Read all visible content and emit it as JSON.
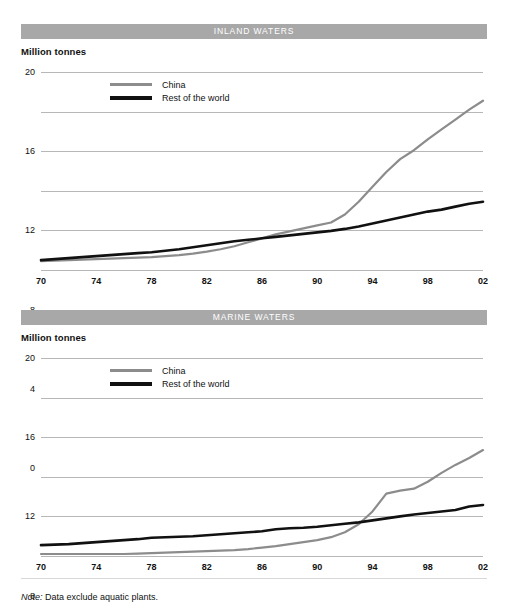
{
  "theme": {
    "bar_gray": "#a8a8a8",
    "china_color": "#8c8c8c",
    "row_color": "#111111",
    "grid_color": "#b7b7b7",
    "background": "#ffffff"
  },
  "charts": [
    {
      "title": "INLAND WATERS",
      "unit_label": "Million tonnes",
      "legend": [
        {
          "label": "China",
          "color": "#8c8c8c"
        },
        {
          "label": "Rest of the world",
          "color": "#111111"
        }
      ]
    },
    {
      "title": "MARINE WATERS",
      "unit_label": "Million tonnes",
      "legend": [
        {
          "label": "China",
          "color": "#8c8c8c"
        },
        {
          "label": "Rest of the world",
          "color": "#111111"
        }
      ]
    }
  ],
  "footnote": {
    "prefix": "Note:",
    "text": " Data exclude aquatic plants."
  },
  "chart_data": [
    {
      "type": "line",
      "title": "INLAND WATERS",
      "xlabel": "",
      "ylabel": "Million tonnes",
      "ylim": [
        0,
        20
      ],
      "yticks": [
        0,
        4,
        8,
        12,
        16,
        20
      ],
      "xlim": [
        1970,
        2002
      ],
      "xticks": [
        1970,
        1974,
        1978,
        1982,
        1986,
        1990,
        1994,
        1998,
        2002
      ],
      "xticklabels": [
        "70",
        "74",
        "78",
        "82",
        "86",
        "90",
        "94",
        "98",
        "02"
      ],
      "grid": true,
      "legend_position": "upper-left-inside",
      "x": [
        1970,
        1971,
        1972,
        1973,
        1974,
        1975,
        1976,
        1977,
        1978,
        1979,
        1980,
        1981,
        1982,
        1983,
        1984,
        1985,
        1986,
        1987,
        1988,
        1989,
        1990,
        1991,
        1992,
        1993,
        1994,
        1995,
        1996,
        1997,
        1998,
        1999,
        2000,
        2001,
        2002
      ],
      "series": [
        {
          "name": "China",
          "color": "#8c8c8c",
          "values": [
            0.9,
            0.95,
            1.0,
            1.05,
            1.1,
            1.15,
            1.2,
            1.25,
            1.3,
            1.4,
            1.5,
            1.65,
            1.85,
            2.1,
            2.4,
            2.8,
            3.2,
            3.6,
            3.9,
            4.2,
            4.5,
            4.8,
            5.6,
            6.9,
            8.4,
            9.9,
            11.2,
            12.1,
            13.2,
            14.2,
            15.2,
            16.2,
            17.1
          ]
        },
        {
          "name": "Rest of the world",
          "color": "#111111",
          "values": [
            1.0,
            1.1,
            1.2,
            1.3,
            1.4,
            1.5,
            1.6,
            1.7,
            1.8,
            1.95,
            2.1,
            2.3,
            2.5,
            2.7,
            2.9,
            3.05,
            3.2,
            3.35,
            3.5,
            3.65,
            3.8,
            3.95,
            4.15,
            4.4,
            4.7,
            5.0,
            5.3,
            5.6,
            5.9,
            6.1,
            6.4,
            6.7,
            6.9
          ]
        }
      ]
    },
    {
      "type": "line",
      "title": "MARINE WATERS",
      "xlabel": "",
      "ylabel": "Million tonnes",
      "ylim": [
        0,
        20
      ],
      "yticks": [
        0,
        4,
        8,
        12,
        16,
        20
      ],
      "xlim": [
        1970,
        2002
      ],
      "xticks": [
        1970,
        1974,
        1978,
        1982,
        1986,
        1990,
        1994,
        1998,
        2002
      ],
      "xticklabels": [
        "70",
        "74",
        "78",
        "82",
        "86",
        "90",
        "94",
        "98",
        "02"
      ],
      "grid": true,
      "legend_position": "upper-left-inside",
      "x": [
        1970,
        1971,
        1972,
        1973,
        1974,
        1975,
        1976,
        1977,
        1978,
        1979,
        1980,
        1981,
        1982,
        1983,
        1984,
        1985,
        1986,
        1987,
        1988,
        1989,
        1990,
        1991,
        1992,
        1993,
        1994,
        1995,
        1996,
        1997,
        1998,
        1999,
        2000,
        2001,
        2002
      ],
      "series": [
        {
          "name": "China",
          "color": "#8c8c8c",
          "values": [
            0.2,
            0.2,
            0.2,
            0.2,
            0.2,
            0.2,
            0.2,
            0.25,
            0.3,
            0.35,
            0.4,
            0.45,
            0.5,
            0.55,
            0.6,
            0.7,
            0.85,
            1.0,
            1.2,
            1.4,
            1.6,
            1.9,
            2.4,
            3.2,
            4.5,
            6.3,
            6.6,
            6.8,
            7.5,
            8.4,
            9.2,
            9.9,
            10.7
          ]
        },
        {
          "name": "Rest of the world",
          "color": "#111111",
          "values": [
            1.1,
            1.15,
            1.2,
            1.3,
            1.4,
            1.5,
            1.6,
            1.7,
            1.85,
            1.9,
            1.95,
            2.0,
            2.1,
            2.2,
            2.3,
            2.4,
            2.5,
            2.7,
            2.8,
            2.85,
            2.95,
            3.1,
            3.25,
            3.4,
            3.6,
            3.8,
            4.0,
            4.2,
            4.35,
            4.5,
            4.65,
            5.0,
            5.15
          ]
        }
      ]
    }
  ]
}
